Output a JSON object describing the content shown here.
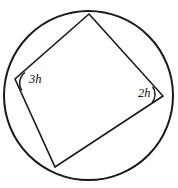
{
  "figure": {
    "type": "geometry-diagram",
    "background_color": "#ffffff",
    "stroke_color": "#1a1a1a",
    "circle": {
      "name": "circumscribed-circle",
      "center_x": 88.5,
      "center_y": 95.5,
      "radius": 84.5,
      "stroke_width": 2.0
    },
    "quadrilateral": {
      "name": "inscribed-quadrilateral",
      "stroke_width": 1.6,
      "fill": "none",
      "vertices": [
        {
          "name": "vertex-top",
          "x": 89,
          "y": 14
        },
        {
          "name": "vertex-right",
          "x": 163,
          "y": 96
        },
        {
          "name": "vertex-bottom",
          "x": 55,
          "y": 167
        },
        {
          "name": "vertex-left",
          "x": 15,
          "y": 79
        }
      ],
      "edges": [
        {
          "name": "edge-top-right",
          "from": "vertex-top",
          "to": "vertex-right"
        },
        {
          "name": "edge-right-bottom",
          "from": "vertex-right",
          "to": "vertex-bottom"
        },
        {
          "name": "edge-bottom-left",
          "from": "vertex-bottom",
          "to": "vertex-left"
        },
        {
          "name": "edge-left-top",
          "from": "vertex-left",
          "to": "vertex-top"
        }
      ]
    },
    "angle_marks": [
      {
        "name": "angle-arc-left",
        "at_vertex": "vertex-left",
        "label": "3h",
        "label_x": 29,
        "label_y": 73,
        "arc_radius": 13,
        "arc_path": "M 21.9 90.3 A 13 13 0 0 1 25.0 72.5"
      },
      {
        "name": "angle-arc-right",
        "at_vertex": "vertex-right",
        "label": "2h",
        "label_x": 138,
        "label_y": 87,
        "arc_radius": 13,
        "arc_path": "M 152.1 102.6 A 13 13 0 0 0 152.6 86.7"
      }
    ],
    "labels": {
      "left_angle": "3h",
      "right_angle": "2h"
    }
  }
}
